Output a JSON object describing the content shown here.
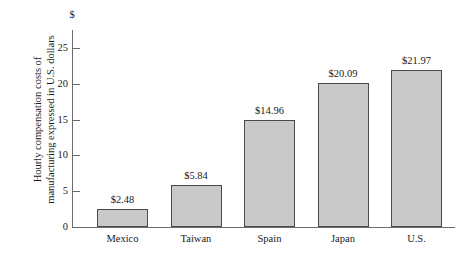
{
  "chart_data": {
    "type": "bar",
    "title": "",
    "subtitle": "",
    "xlabel": "",
    "ylabel": "Hourly compensation costs of manufacturing expressed in U.S. dollars",
    "ylabel_lines": [
      "Hourly compensation costs of",
      "manufacturing expressed in U.S. dollars"
    ],
    "currency_marker": "$",
    "categories": [
      "Mexico",
      "Taiwan",
      "Spain",
      "Japan",
      "U.S."
    ],
    "values": [
      2.48,
      5.84,
      14.96,
      20.09,
      21.97
    ],
    "data_labels": [
      "$2.48",
      "$5.84",
      "$14.96",
      "$20.09",
      "$21.97"
    ],
    "ylim": [
      0,
      27.5
    ],
    "yticks": [
      0,
      5,
      10,
      15,
      20,
      25
    ],
    "ytick_labels": [
      "0",
      "5",
      "10",
      "15",
      "20",
      "25"
    ],
    "grid": false,
    "legend": false,
    "legend_position": "none",
    "bar_color": "#c9c9c9",
    "bar_border_color": "#4a4a4a",
    "axis_color": "#6d6d6d"
  }
}
